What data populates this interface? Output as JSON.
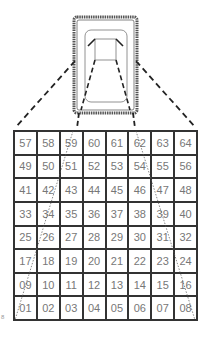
{
  "figure": {
    "type": "projection-diagram",
    "device_label": "",
    "side_mark": "8",
    "colors": {
      "line": "#333333",
      "text": "#777777",
      "device_border": "#555555"
    }
  },
  "grid": {
    "rows": 8,
    "cols": 8,
    "cells": [
      [
        "57",
        "58",
        "59",
        "60",
        "61",
        "62",
        "63",
        "64"
      ],
      [
        "49",
        "50",
        "51",
        "52",
        "53",
        "54",
        "55",
        "56"
      ],
      [
        "41",
        "42",
        "43",
        "44",
        "45",
        "46",
        "47",
        "48"
      ],
      [
        "33",
        "34",
        "35",
        "36",
        "37",
        "38",
        "39",
        "40"
      ],
      [
        "25",
        "26",
        "27",
        "28",
        "29",
        "30",
        "31",
        "32"
      ],
      [
        "17",
        "18",
        "19",
        "20",
        "21",
        "22",
        "23",
        "24"
      ],
      [
        "09",
        "10",
        "11",
        "12",
        "13",
        "14",
        "15",
        "16"
      ],
      [
        "01",
        "02",
        "03",
        "04",
        "05",
        "06",
        "07",
        "08"
      ]
    ]
  }
}
